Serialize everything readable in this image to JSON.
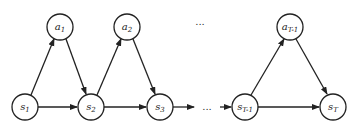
{
  "diagram": {
    "type": "markov-decision-chain",
    "colors": {
      "stroke": "#222222",
      "fill": "#ffffff",
      "background": "#ffffff"
    },
    "nodes": [
      {
        "id": "a1",
        "base": "a",
        "sub": "1",
        "cx": 60,
        "cy": 27,
        "row": "action"
      },
      {
        "id": "a2",
        "base": "a",
        "sub": "2",
        "cx": 127,
        "cy": 27,
        "row": "action"
      },
      {
        "id": "aT1",
        "base": "a",
        "sub": "T-1",
        "cx": 290,
        "cy": 27,
        "row": "action"
      },
      {
        "id": "s1",
        "base": "s",
        "sub": "1",
        "cx": 25,
        "cy": 107,
        "row": "state"
      },
      {
        "id": "s2",
        "base": "s",
        "sub": "2",
        "cx": 91,
        "cy": 107,
        "row": "state"
      },
      {
        "id": "s3",
        "base": "s",
        "sub": "3",
        "cx": 160,
        "cy": 107,
        "row": "state"
      },
      {
        "id": "sT1",
        "base": "s",
        "sub": "T-1",
        "cx": 245,
        "cy": 107,
        "row": "state"
      },
      {
        "id": "sT",
        "base": "s",
        "sub": "T",
        "cx": 333,
        "cy": 107,
        "row": "state"
      }
    ],
    "ellipses": [
      {
        "text": "...",
        "x": 200,
        "y": 25
      },
      {
        "text": "...",
        "x": 212,
        "y": 108
      }
    ],
    "edges": [
      {
        "from": "s1",
        "to": "a1"
      },
      {
        "from": "a1",
        "to": "s2"
      },
      {
        "from": "s1",
        "to": "s2"
      },
      {
        "from": "s2",
        "to": "a2"
      },
      {
        "from": "a2",
        "to": "s3"
      },
      {
        "from": "s2",
        "to": "s3"
      },
      {
        "from": "s3",
        "to": "dots"
      },
      {
        "from": "dots",
        "to": "sT1"
      },
      {
        "from": "sT1",
        "to": "aT1"
      },
      {
        "from": "aT1",
        "to": "sT"
      },
      {
        "from": "sT1",
        "to": "sT"
      }
    ]
  }
}
